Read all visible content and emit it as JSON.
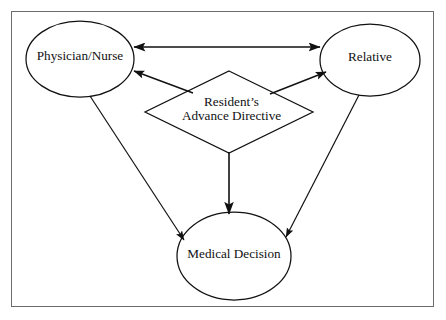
{
  "figure": {
    "type": "flow-diagram",
    "border_color": "#6b6b6b",
    "stroke_color": "#111111",
    "background": "#ffffff"
  },
  "nodes": {
    "physician_nurse": {
      "label": "Physician/Nurse",
      "shape": "ellipse",
      "cx": 80,
      "cy": 59,
      "rx": 54,
      "ry": 38
    },
    "relative": {
      "label": "Relative",
      "shape": "ellipse",
      "cx": 370,
      "cy": 60,
      "rx": 50,
      "ry": 36
    },
    "advance_directive": {
      "label_line1": "Resident’s",
      "label_line2": "Advance Directive",
      "shape": "diamond",
      "cx": 229,
      "cy": 112,
      "rx": 84,
      "ry": 41
    },
    "medical_decision": {
      "label": "Medical Decision",
      "shape": "ellipse",
      "cx": 234,
      "cy": 256,
      "rx": 57,
      "ry": 44
    }
  },
  "edges": [
    {
      "name": "physician-relative",
      "from": "physician_nurse",
      "to": "relative",
      "arrowheads": "both",
      "x1": 134,
      "y1": 47,
      "x2": 320,
      "y2": 47
    },
    {
      "name": "directive-physician",
      "from": "advance_directive",
      "to": "physician_nurse",
      "arrowheads": "end",
      "x1": 191,
      "y1": 92,
      "x2": 133,
      "y2": 71
    },
    {
      "name": "directive-relative",
      "from": "advance_directive",
      "to": "relative",
      "arrowheads": "end",
      "x1": 272,
      "y1": 93,
      "x2": 327,
      "y2": 72
    },
    {
      "name": "directive-medical-decision",
      "from": "advance_directive",
      "to": "medical_decision",
      "arrowheads": "end",
      "x1": 229,
      "y1": 152,
      "x2": 229,
      "y2": 213
    },
    {
      "name": "physician-medical-decision",
      "from": "physician_nurse",
      "to": "medical_decision",
      "arrowheads": "end",
      "x1": 90,
      "y1": 96,
      "x2": 183,
      "y2": 239
    },
    {
      "name": "relative-medical-decision",
      "from": "relative",
      "to": "medical_decision",
      "arrowheads": "end",
      "x1": 359,
      "y1": 95,
      "x2": 287,
      "y2": 236
    }
  ]
}
